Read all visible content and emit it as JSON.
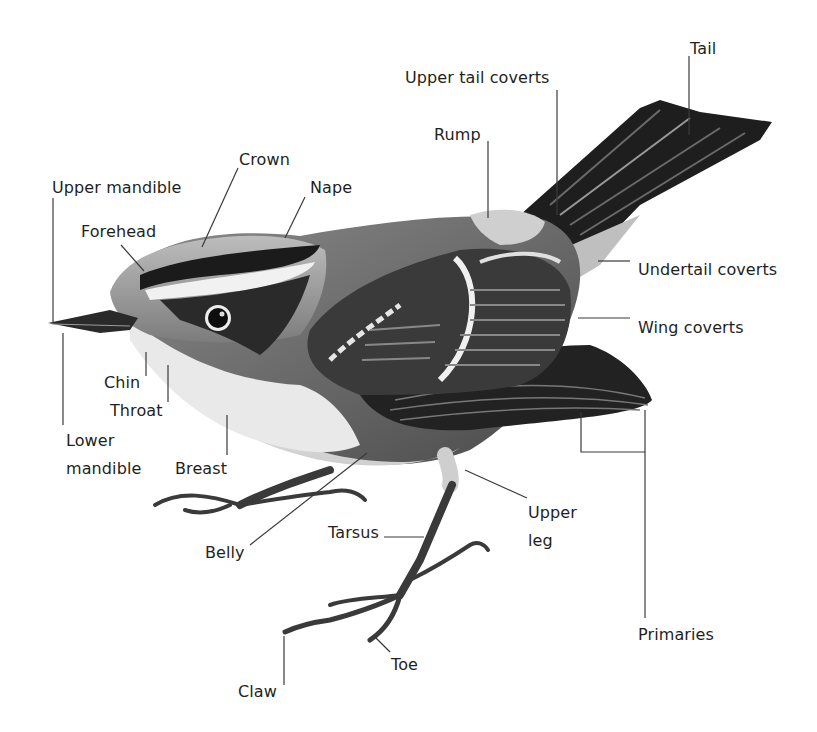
{
  "diagram": {
    "background": "#ffffff",
    "label_color": "#231f20",
    "leader_color": "#3a3a3a",
    "labels": [
      {
        "id": "crown",
        "text": "Crown",
        "x": 239,
        "y": 150
      },
      {
        "id": "upper-mandible",
        "text": "Upper mandible",
        "x": 52,
        "y": 178
      },
      {
        "id": "nape",
        "text": "Nape",
        "x": 310,
        "y": 178
      },
      {
        "id": "forehead",
        "text": "Forehead",
        "x": 81,
        "y": 222
      },
      {
        "id": "rump",
        "text": "Rump",
        "x": 434,
        "y": 125
      },
      {
        "id": "upper-tail-coverts",
        "text": "Upper tail coverts",
        "x": 405,
        "y": 68
      },
      {
        "id": "tail",
        "text": "Tail",
        "x": 690,
        "y": 39
      },
      {
        "id": "undertail-coverts",
        "text": "Undertail coverts",
        "x": 638,
        "y": 260
      },
      {
        "id": "wing-coverts",
        "text": "Wing coverts",
        "x": 638,
        "y": 318
      },
      {
        "id": "chin",
        "text": "Chin",
        "x": 104,
        "y": 373
      },
      {
        "id": "throat",
        "text": "Throat",
        "x": 110,
        "y": 401
      },
      {
        "id": "lower-mandible-1",
        "text": "Lower",
        "x": 66,
        "y": 431
      },
      {
        "id": "lower-mandible-2",
        "text": "mandible",
        "x": 66,
        "y": 459
      },
      {
        "id": "breast",
        "text": "Breast",
        "x": 175,
        "y": 459
      },
      {
        "id": "belly",
        "text": "Belly",
        "x": 205,
        "y": 543
      },
      {
        "id": "tarsus",
        "text": "Tarsus",
        "x": 328,
        "y": 523
      },
      {
        "id": "upper-leg-1",
        "text": "Upper",
        "x": 528,
        "y": 503
      },
      {
        "id": "upper-leg-2",
        "text": "leg",
        "x": 528,
        "y": 531
      },
      {
        "id": "primaries",
        "text": "Primaries",
        "x": 638,
        "y": 625
      },
      {
        "id": "toe",
        "text": "Toe",
        "x": 391,
        "y": 655
      },
      {
        "id": "claw",
        "text": "Claw",
        "x": 238,
        "y": 682
      }
    ]
  }
}
